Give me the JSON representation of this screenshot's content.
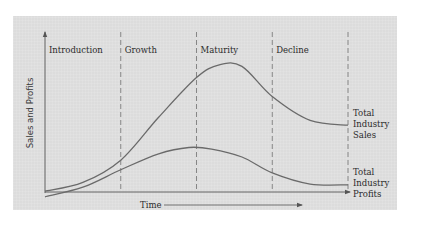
{
  "chart_data": {
    "type": "line",
    "title": "",
    "xlabel": "Time",
    "ylabel": "Sales and Profits",
    "xlim": [
      0,
      4
    ],
    "ylim": [
      -5,
      100
    ],
    "grid": false,
    "stages": [
      "Introduction",
      "Growth",
      "Maturity",
      "Decline"
    ],
    "stage_boundaries": [
      1,
      2,
      3,
      4
    ],
    "series": [
      {
        "name": "Total Industry Sales",
        "label_lines": [
          "Total",
          "Industry",
          "Sales"
        ],
        "x": [
          0,
          0.5,
          1,
          1.5,
          2,
          2.3,
          2.6,
          3,
          3.5,
          4
        ],
        "y": [
          0.5,
          6,
          20,
          47,
          72,
          80,
          79,
          60,
          45,
          42
        ]
      },
      {
        "name": "Total Industry Profits",
        "label_lines": [
          "Total",
          "Industry",
          "Profits"
        ],
        "x": [
          0,
          0.5,
          1,
          1.5,
          1.9,
          2.2,
          2.6,
          3,
          3.5,
          4
        ],
        "y": [
          -3,
          3,
          14,
          24,
          28,
          27,
          22,
          12,
          5,
          4.5
        ]
      }
    ],
    "colors": {
      "curve": "#6a6a6a",
      "axis": "#555555",
      "divider": "#6e6e6e",
      "background": "#dcdcdc"
    }
  }
}
